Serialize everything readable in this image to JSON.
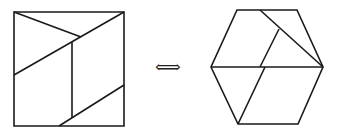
{
  "figure": {
    "stroke_color": "#1a1a1a",
    "background": "#ffffff",
    "arrow_symbol": "⟺",
    "square": {
      "outline": [
        [
          14,
          12
        ],
        [
          124,
          12
        ],
        [
          124,
          126
        ],
        [
          14,
          126
        ]
      ],
      "cuts": [
        [
          [
            14,
            12
          ],
          [
            81,
            37
          ]
        ],
        [
          [
            124,
            12
          ],
          [
            14,
            75
          ]
        ],
        [
          [
            72,
            42
          ],
          [
            72,
            118
          ]
        ],
        [
          [
            124,
            85
          ],
          [
            59,
            126
          ]
        ]
      ]
    },
    "hexagon": {
      "outline": [
        [
          237,
          10
        ],
        [
          297,
          10
        ],
        [
          323,
          67
        ],
        [
          298,
          124
        ],
        [
          238,
          124
        ],
        [
          211,
          67
        ]
      ],
      "cuts": [
        [
          [
            260,
            10
          ],
          [
            323,
            67
          ]
        ],
        [
          [
            279,
            29
          ],
          [
            260,
            67
          ]
        ],
        [
          [
            211,
            67
          ],
          [
            323,
            67
          ]
        ],
        [
          [
            265,
            67
          ],
          [
            238,
            124
          ]
        ]
      ]
    }
  }
}
